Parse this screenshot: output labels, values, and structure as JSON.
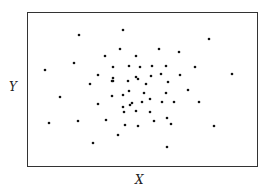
{
  "chart_data": {
    "type": "scatter",
    "title": "",
    "xlabel": "X",
    "ylabel": "Y",
    "grid": false,
    "legend": null,
    "axis_ticks": "none",
    "frame": {
      "left": 27,
      "top": 12,
      "right": 258,
      "bottom": 167
    },
    "point_color": "#111111",
    "points_px": [
      [
        123,
        30
      ],
      [
        79,
        35
      ],
      [
        209,
        39
      ],
      [
        45,
        70
      ],
      [
        74,
        63
      ],
      [
        105,
        56
      ],
      [
        120,
        49
      ],
      [
        136,
        56
      ],
      [
        159,
        49
      ],
      [
        179,
        52
      ],
      [
        113,
        67
      ],
      [
        129,
        66
      ],
      [
        140,
        67
      ],
      [
        152,
        66
      ],
      [
        166,
        66
      ],
      [
        195,
        67
      ],
      [
        232,
        74
      ],
      [
        98,
        75
      ],
      [
        113,
        78
      ],
      [
        136,
        77
      ],
      [
        151,
        76
      ],
      [
        161,
        74
      ],
      [
        180,
        75
      ],
      [
        90,
        84
      ],
      [
        112,
        81
      ],
      [
        113,
        81
      ],
      [
        128,
        81
      ],
      [
        138,
        79
      ],
      [
        146,
        84
      ],
      [
        168,
        82
      ],
      [
        188,
        90
      ],
      [
        60,
        97
      ],
      [
        112,
        96
      ],
      [
        123,
        95
      ],
      [
        129,
        91
      ],
      [
        144,
        93
      ],
      [
        166,
        93
      ],
      [
        199,
        102
      ],
      [
        98,
        104
      ],
      [
        123,
        107
      ],
      [
        132,
        103
      ],
      [
        142,
        102
      ],
      [
        150,
        99
      ],
      [
        162,
        102
      ],
      [
        174,
        102
      ],
      [
        49,
        123
      ],
      [
        78,
        121
      ],
      [
        106,
        120
      ],
      [
        136,
        111
      ],
      [
        130,
        105
      ],
      [
        124,
        112
      ],
      [
        150,
        112
      ],
      [
        167,
        118
      ],
      [
        171,
        124
      ],
      [
        214,
        126
      ],
      [
        125,
        125
      ],
      [
        138,
        126
      ],
      [
        93,
        143
      ],
      [
        167,
        147
      ],
      [
        118,
        135
      ],
      [
        154,
        121
      ]
    ]
  },
  "labels": {
    "x": "X",
    "y": "Y"
  }
}
